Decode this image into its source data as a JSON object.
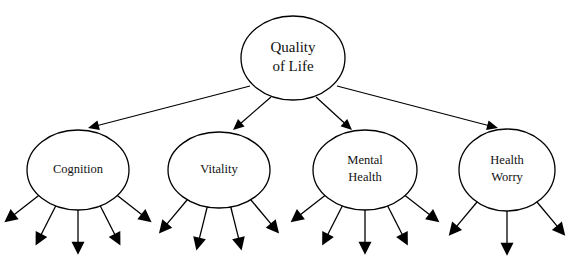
{
  "diagram": {
    "type": "hierarchy-tree",
    "background_color": "#ffffff",
    "line_color": "#000000",
    "text_color": "#111111",
    "root": {
      "id": "quality-of-life",
      "label_line1": "Quality",
      "label_line2": "of Life",
      "label_full": "Quality of Life",
      "cx": 293,
      "cy": 58,
      "rx": 52,
      "ry": 42
    },
    "children": [
      {
        "id": "cognition",
        "label_line1": "Cognition",
        "label_line2": "",
        "label_full": "Cognition",
        "cx": 78,
        "cy": 170,
        "rx": 51,
        "ry": 40,
        "leaf_count": 5,
        "leaf_angles_deg": [
          -52,
          -27,
          0,
          27,
          52
        ]
      },
      {
        "id": "vitality",
        "label_line1": "Vitality",
        "label_line2": "",
        "label_full": "Vitality",
        "cx": 219,
        "cy": 170,
        "rx": 51,
        "ry": 38,
        "leaf_count": 4,
        "leaf_angles_deg": [
          -40,
          -14,
          14,
          40
        ]
      },
      {
        "id": "mental-health",
        "label_line1": "Mental",
        "label_line2": "Health",
        "label_full": "Mental Health",
        "cx": 365,
        "cy": 170,
        "rx": 52,
        "ry": 40,
        "leaf_count": 5,
        "leaf_angles_deg": [
          -52,
          -27,
          0,
          27,
          52
        ]
      },
      {
        "id": "health-worry",
        "label_line1": "Health",
        "label_line2": "Worry",
        "label_full": "Health Worry",
        "cx": 507,
        "cy": 170,
        "rx": 48,
        "ry": 41,
        "leaf_count": 3,
        "leaf_angles_deg": [
          -40,
          0,
          40
        ]
      }
    ],
    "edges": [
      {
        "id": "edge-root-cognition",
        "from": "quality-of-life",
        "to": "cognition",
        "x1": 250,
        "y1": 86,
        "x2": 88,
        "y2": 128
      },
      {
        "id": "edge-root-vitality",
        "from": "quality-of-life",
        "to": "vitality",
        "x1": 271,
        "y1": 97,
        "x2": 233,
        "y2": 130
      },
      {
        "id": "edge-root-mental-health",
        "from": "quality-of-life",
        "to": "mental-health",
        "x1": 316,
        "y1": 97,
        "x2": 352,
        "y2": 130
      },
      {
        "id": "edge-root-health-worry",
        "from": "quality-of-life",
        "to": "health-worry",
        "x1": 337,
        "y1": 86,
        "x2": 498,
        "y2": 128
      }
    ],
    "leaf_line_length": 46
  }
}
